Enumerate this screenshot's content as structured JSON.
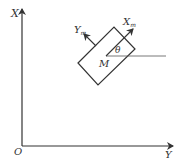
{
  "diagram": {
    "type": "coordinate-frame",
    "global_axes": {
      "vertical_label": "X",
      "horizontal_label": "Y",
      "origin_label": "O"
    },
    "body_frame": {
      "x_axis_label": "X",
      "x_axis_subscript": "m",
      "y_axis_label": "Y",
      "y_axis_subscript": "m",
      "center_label": "M",
      "angle_label": "θ"
    },
    "colors": {
      "stroke": "#333333",
      "background": "#ffffff"
    }
  }
}
